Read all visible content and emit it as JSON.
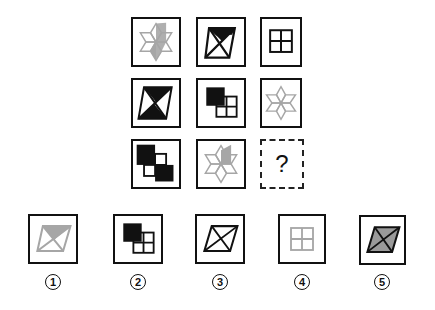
{
  "puzzle": {
    "grid": [
      [
        {
          "shape": "star-gray-half"
        },
        {
          "shape": "hourglass-top-black"
        },
        {
          "shape": "window-grid-black"
        }
      ],
      [
        {
          "shape": "hourglass-both-black"
        },
        {
          "shape": "squares-one-black"
        },
        {
          "shape": "star-gray-outline"
        }
      ],
      [
        {
          "shape": "squares-two-black"
        },
        {
          "shape": "star-gray-right-half"
        },
        {
          "shape": "unknown",
          "text": "?"
        }
      ]
    ],
    "question_mark": "?"
  },
  "options": [
    {
      "label": "①",
      "number": "1",
      "shape": "parallelogram-gray-top-filled"
    },
    {
      "label": "②",
      "number": "2",
      "shape": "squares-one-black"
    },
    {
      "label": "③",
      "number": "3",
      "shape": "parallelogram-black-outline"
    },
    {
      "label": "④",
      "number": "4",
      "shape": "window-grid-gray"
    },
    {
      "label": "⑤",
      "number": "5",
      "shape": "parallelogram-gray-filled"
    }
  ],
  "colors": {
    "black": "#111111",
    "gray": "#a6a6a6",
    "fill_gray": "#9a9a9a"
  }
}
